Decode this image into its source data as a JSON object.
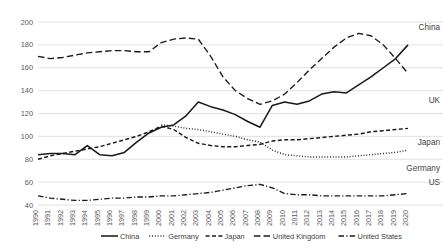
{
  "chart_data": {
    "type": "line",
    "title": "",
    "xlabel": "",
    "ylabel": "",
    "ylim": [
      40,
      200
    ],
    "yticks": [
      40,
      60,
      80,
      100,
      120,
      140,
      160,
      180,
      200
    ],
    "grid": true,
    "legend_position": "bottom",
    "x": [
      1990,
      1991,
      1992,
      1993,
      1994,
      1995,
      1996,
      1997,
      1998,
      1999,
      2000,
      2001,
      2002,
      2003,
      2004,
      2005,
      2006,
      2007,
      2008,
      2009,
      2010,
      2011,
      2012,
      2013,
      2014,
      2015,
      2016,
      2017,
      2018,
      2019,
      2020
    ],
    "categories": [
      "1990",
      "1991",
      "1992",
      "1993",
      "1994",
      "1995",
      "1996",
      "1997",
      "1998",
      "1999",
      "2000",
      "2001",
      "2002",
      "2003",
      "2004",
      "2005",
      "2006",
      "2007",
      "2008",
      "2009",
      "2010",
      "2011",
      "2012",
      "2013",
      "2014",
      "2015",
      "2016",
      "2017",
      "2018",
      "2019",
      "2020"
    ],
    "series": [
      {
        "name": "China",
        "style": "solid",
        "end_label": "China",
        "values": [
          84,
          85,
          85,
          84,
          92,
          84,
          83,
          86,
          95,
          103,
          108,
          110,
          118,
          130,
          126,
          123,
          119,
          113,
          108,
          127,
          130,
          128,
          131,
          137,
          139,
          138,
          145,
          152,
          160,
          168,
          180
        ]
      },
      {
        "name": "Germany",
        "style": "dotted",
        "end_label": "Germany",
        "values": [
          null,
          null,
          null,
          null,
          null,
          null,
          null,
          null,
          null,
          null,
          110,
          109,
          107,
          106,
          104,
          102,
          100,
          97,
          95,
          88,
          84,
          83,
          82,
          82,
          82,
          82,
          83,
          84,
          85,
          86,
          88
        ]
      },
      {
        "name": "Japan",
        "style": "dashed",
        "end_label": "Japan",
        "values": [
          80,
          83,
          85,
          87,
          89,
          91,
          94,
          97,
          100,
          104,
          109,
          106,
          99,
          94,
          92,
          91,
          91,
          92,
          93,
          96,
          97,
          97,
          98,
          99,
          100,
          101,
          102,
          104,
          105,
          106,
          107
        ]
      },
      {
        "name": "United Kingdom",
        "style": "long-dash",
        "end_label": "UK",
        "values": [
          170,
          168,
          169,
          171,
          173,
          174,
          175,
          175,
          174,
          174,
          182,
          185,
          186,
          185,
          170,
          152,
          140,
          133,
          128,
          131,
          137,
          147,
          158,
          168,
          178,
          186,
          190,
          188,
          180,
          168,
          155
        ]
      },
      {
        "name": "United States",
        "style": "dash-dot",
        "end_label": "US",
        "values": [
          48,
          46,
          45,
          44,
          44,
          45,
          46,
          46,
          47,
          47,
          48,
          48,
          49,
          50,
          51,
          53,
          55,
          57,
          58,
          55,
          50,
          49,
          49,
          48,
          48,
          48,
          48,
          48,
          48,
          49,
          50
        ]
      }
    ]
  },
  "legend": {
    "items": [
      {
        "label": "China",
        "style": "solid"
      },
      {
        "label": "Germany",
        "style": "dotted"
      },
      {
        "label": "Japan",
        "style": "dashed"
      },
      {
        "label": "United Kingdom",
        "style": "long-dash"
      },
      {
        "label": "United States",
        "style": "dash-dot"
      }
    ]
  }
}
